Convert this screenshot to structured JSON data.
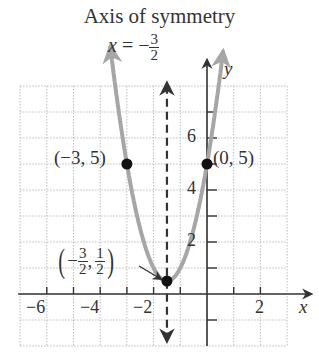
{
  "title": "Axis of symmetry",
  "equation": {
    "lhs": "x",
    "op": "=",
    "sign": "−",
    "num": "3",
    "den": "2"
  },
  "axes": {
    "x_label": "x",
    "y_label": "y"
  },
  "points": {
    "left": "(−3, 5)",
    "right": "(0, 5)",
    "vertex": {
      "open": "(",
      "sign": "−",
      "xnum": "3",
      "xden": "2",
      "comma": ",",
      "ynum": "1",
      "yden": "2",
      "close": ")"
    }
  },
  "x_tick_labels": [
    "−6",
    "−4",
    "−2",
    "2"
  ],
  "y_tick_labels": [
    "2",
    "4",
    "6"
  ],
  "colors": {
    "parabola": "#a6a6a6",
    "axis": "#333333",
    "grid": "#bdbdbd",
    "point": "#111111"
  },
  "chart_data": {
    "type": "line",
    "title": "Axis of symmetry",
    "subtitle": "x = −3/2",
    "xlabel": "x",
    "ylabel": "y",
    "xlim": [
      -7,
      3
    ],
    "ylim": [
      -2,
      8
    ],
    "grid": true,
    "x_ticks": [
      -6,
      -5,
      -4,
      -3,
      -2,
      -1,
      0,
      1,
      2
    ],
    "x_tick_labels": [
      "−6",
      "−4",
      "−2",
      "2"
    ],
    "y_ticks": [
      -1,
      1,
      2,
      3,
      4,
      5,
      6,
      7
    ],
    "y_tick_labels": [
      "2",
      "4",
      "6"
    ],
    "series": [
      {
        "name": "parabola",
        "function": "y = 2(x + 3/2)^2 + 1/2 = 2x^2 + 6x + 5",
        "x_range": [
          -3.6,
          0.6
        ],
        "arrows": "both ends"
      },
      {
        "name": "axis of symmetry",
        "function": "x = -1.5",
        "style": "dashed",
        "arrows": "both ends"
      }
    ],
    "points": [
      {
        "x": -3,
        "y": 5,
        "label": "(−3, 5)"
      },
      {
        "x": 0,
        "y": 5,
        "label": "(0, 5)"
      },
      {
        "x": -1.5,
        "y": 0.5,
        "label": "(−3/2, 1/2)",
        "annotation": "vertex"
      }
    ],
    "annotations": [
      "Axis of symmetry",
      "x = −3/2"
    ]
  }
}
